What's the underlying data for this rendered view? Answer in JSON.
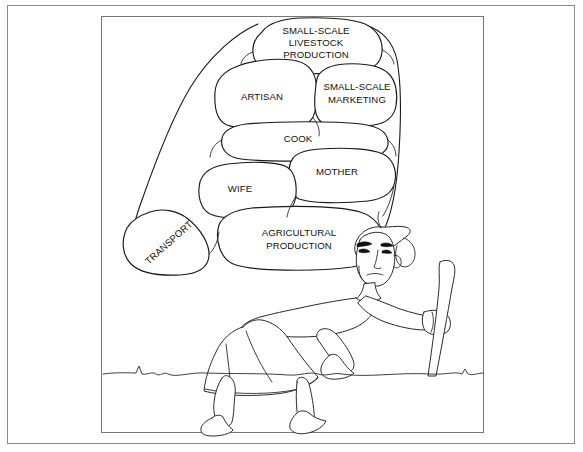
{
  "figure": {
    "title_present": false,
    "ground_line": "wavy-ground-line",
    "person": {
      "name": "woman-carrying-load",
      "holds": "walking-stick",
      "headwear": "headscarf",
      "expression": "tired"
    },
    "bundle": {
      "name": "load-bundle",
      "sacks": [
        {
          "id": "livestock",
          "lines": [
            "SMALL-SCALE",
            "LIVESTOCK",
            "PRODUCTION"
          ],
          "cx": 316,
          "cy": 43,
          "rotate": 0
        },
        {
          "id": "artisan",
          "lines": [
            "ARTISAN"
          ],
          "cx": 262,
          "cy": 97,
          "rotate": 0
        },
        {
          "id": "marketing",
          "lines": [
            "SMALL-SCALE",
            "MARKETING"
          ],
          "cx": 357,
          "cy": 92,
          "rotate": 0
        },
        {
          "id": "cook",
          "lines": [
            "COOK"
          ],
          "cx": 298,
          "cy": 139,
          "rotate": 0
        },
        {
          "id": "mother",
          "lines": [
            "MOTHER"
          ],
          "cx": 335,
          "cy": 172,
          "rotate": 0
        },
        {
          "id": "wife",
          "lines": [
            "WIFE"
          ],
          "cx": 238,
          "cy": 189,
          "rotate": 0
        },
        {
          "id": "agriculture",
          "lines": [
            "AGRICULTURAL",
            "PRODUCTION"
          ],
          "cx": 299,
          "cy": 233,
          "rotate": 0
        },
        {
          "id": "transport",
          "lines": [
            "TRANSPORT"
          ],
          "cx": 171,
          "cy": 243,
          "rotate": -42
        }
      ]
    }
  },
  "colors": {
    "ink": "#1a1a1a",
    "paper": "#ffffff",
    "border": "#8a8a8a",
    "frame": "#777777"
  }
}
